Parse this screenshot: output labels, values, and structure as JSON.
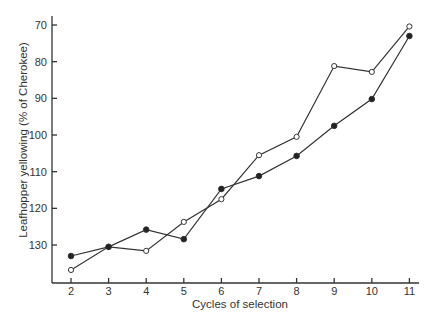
{
  "chart_data": {
    "type": "line",
    "title": "",
    "xlabel": "Cycles of selection",
    "ylabel": "Leafhopper yellowing (% of Cherokee)",
    "x": [
      2,
      3,
      4,
      5,
      6,
      7,
      8,
      9,
      10,
      11
    ],
    "x_ticks": [
      "2",
      "3",
      "4",
      "5",
      "6",
      "7",
      "8",
      "9",
      "10",
      "11"
    ],
    "y_ticks": [
      "70",
      "80",
      "90",
      "100",
      "110",
      "120",
      "130"
    ],
    "y_inverted": true,
    "ylim": [
      137,
      68
    ],
    "grid": false,
    "legend": "none",
    "series": [
      {
        "name": "open-circle series",
        "marker": "open-circle",
        "values": [
          136.8,
          130.5,
          131.6,
          123.7,
          117.5,
          105.5,
          100.5,
          81.2,
          82.8,
          70.4
        ]
      },
      {
        "name": "filled-circle series",
        "marker": "filled-circle",
        "values": [
          133.0,
          130.5,
          125.8,
          128.4,
          114.7,
          111.2,
          105.7,
          97.5,
          90.2,
          73.0
        ]
      }
    ],
    "colors": {
      "line": "#333333",
      "text": "#333333",
      "background": "#ffffff"
    }
  }
}
